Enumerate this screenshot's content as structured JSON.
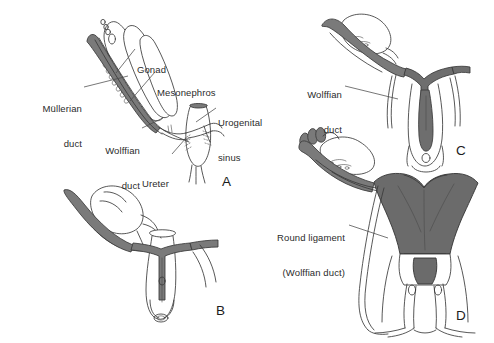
{
  "figure": {
    "width": 494,
    "height": 343,
    "background": "#ffffff",
    "colors": {
      "outline": "#3a3a3a",
      "mullerian_duct_fill": "#7a7a7a",
      "wolffian_duct_fill": "#6e6e6e",
      "uterus_fill": "#6b6b6b",
      "label_text": "#2b2b2b",
      "panel_letter": "#1c1c1c",
      "leader_line": "#4a4a4a"
    }
  },
  "panels": [
    {
      "id": "A",
      "letter": "A",
      "letter_pos": {
        "x": 222,
        "y": 174
      },
      "caption": "Indifferent stage: paired Mullerian and Wolffian ducts with gonad, mesonephros, ureter and urogenital sinus",
      "labels": [
        {
          "name": "mullerian-duct",
          "lines": [
            "Müllerian",
            "duct"
          ],
          "x": 14,
          "y": 80,
          "width": 68,
          "align": "right",
          "leader": {
            "x1": 84,
            "y1": 87,
            "x2": 128,
            "y2": 76
          }
        },
        {
          "name": "gonad",
          "lines": [
            "Gonad"
          ],
          "x": 137,
          "y": 41,
          "width": 40,
          "align": "left",
          "leader": {
            "x1": 135,
            "y1": 49,
            "x2": 116,
            "y2": 73
          }
        },
        {
          "name": "mesonephros",
          "lines": [
            "Mesonephros"
          ],
          "x": 157,
          "y": 64,
          "width": 74,
          "align": "left",
          "leader": {
            "x1": 155,
            "y1": 72,
            "x2": 130,
            "y2": 101
          }
        },
        {
          "name": "wolffian-duct",
          "lines": [
            "Wolffian",
            "duct"
          ],
          "x": 84,
          "y": 122,
          "width": 56,
          "align": "right",
          "leader": {
            "x1": 142,
            "y1": 128,
            "x2": 163,
            "y2": 118
          }
        },
        {
          "name": "ureter",
          "lines": [
            "Ureter"
          ],
          "x": 142,
          "y": 155,
          "width": 40,
          "align": "left",
          "leader": {
            "x1": 172,
            "y1": 154,
            "x2": 186,
            "y2": 138
          }
        },
        {
          "name": "urogenital-sinus",
          "lines": [
            "Urogenital",
            "sinus"
          ],
          "x": 218,
          "y": 94,
          "width": 60,
          "align": "left",
          "leader": {
            "x1": 216,
            "y1": 108,
            "x2": 196,
            "y2": 122
          }
        }
      ]
    },
    {
      "id": "B",
      "letter": "B",
      "letter_pos": {
        "x": 216,
        "y": 303
      },
      "caption": "Mullerian ducts approach the midline and begin to fuse at the urogenital sinus",
      "labels": []
    },
    {
      "id": "C",
      "letter": "C",
      "letter_pos": {
        "x": 456,
        "y": 143
      },
      "caption": "Fused Mullerian ducts form the uterovaginal canal; Wolffian ducts regress",
      "labels": [
        {
          "name": "wolffian-duct",
          "lines": [
            "Wolffian",
            "duct"
          ],
          "x": 288,
          "y": 66,
          "width": 54,
          "align": "right",
          "leader": {
            "x1": 345,
            "y1": 86,
            "x2": 398,
            "y2": 99
          }
        }
      ]
    },
    {
      "id": "D",
      "letter": "D",
      "letter_pos": {
        "x": 456,
        "y": 308
      },
      "caption": "Mature uterus, fallopian tubes and vagina; the Wolffian duct remnant persists as the round ligament",
      "labels": [
        {
          "name": "round-ligament",
          "lines": [
            "Round ligament",
            "(Wolffian duct)"
          ],
          "x": 255,
          "y": 209,
          "width": 90,
          "align": "right",
          "leader": {
            "x1": 349,
            "y1": 225,
            "x2": 388,
            "y2": 238
          }
        }
      ]
    }
  ]
}
